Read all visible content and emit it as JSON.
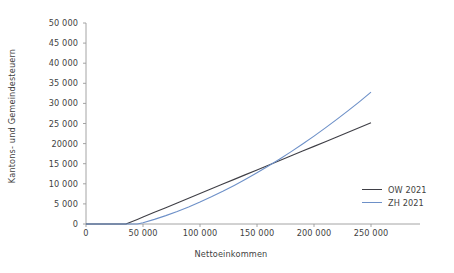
{
  "chart_data": {
    "type": "line",
    "title": "",
    "xlabel": "Nettoeinkommen",
    "ylabel": "Kantons- und Gemeindesteuern",
    "xlim": [
      0,
      250000
    ],
    "ylim": [
      0,
      50000
    ],
    "grid": false,
    "legend_position": "bottom-right",
    "xticks": [
      0,
      50000,
      100000,
      150000,
      200000,
      250000
    ],
    "xtick_labels": [
      "0",
      "50 000",
      "100 000",
      "150 000",
      "200 000",
      "250 000"
    ],
    "yticks": [
      0,
      5000,
      10000,
      15000,
      20000,
      25000,
      30000,
      35000,
      40000,
      45000,
      50000
    ],
    "ytick_labels": [
      "0",
      "5 000",
      "10 000",
      "15 000",
      "20000",
      "25 000",
      "30 000",
      "35 000",
      "40 000",
      "45 000",
      "50 000"
    ],
    "x": [
      0,
      10000,
      20000,
      30000,
      35000,
      40000,
      45000,
      50000,
      60000,
      70000,
      80000,
      90000,
      100000,
      110000,
      120000,
      130000,
      140000,
      150000,
      160000,
      170000,
      180000,
      190000,
      200000,
      210000,
      220000,
      230000,
      240000,
      250000
    ],
    "series": [
      {
        "name": "OW 2021",
        "color": "#3f3f46",
        "values": [
          0,
          0,
          0,
          0,
          0,
          570,
          1140,
          1720,
          2900,
          4070,
          5240,
          6420,
          7590,
          8760,
          9930,
          11100,
          12280,
          13450,
          14620,
          15790,
          16970,
          18140,
          19310,
          20480,
          21650,
          22830,
          24000,
          25200
        ]
      },
      {
        "name": "ZH 2021",
        "color": "#6d90c8",
        "values": [
          0,
          0,
          0,
          0,
          0,
          0,
          0,
          330,
          1150,
          2080,
          3120,
          4250,
          5460,
          6760,
          8140,
          9600,
          11130,
          12740,
          14420,
          16180,
          18000,
          19900,
          21870,
          23910,
          26020,
          28200,
          30450,
          32800
        ]
      }
    ]
  },
  "legend": {
    "items": [
      {
        "label": "OW 2021",
        "color": "#3f3f46"
      },
      {
        "label": "ZH 2021",
        "color": "#6d90c8"
      }
    ]
  },
  "axes": {
    "axis_color": "#9a9a9a"
  }
}
